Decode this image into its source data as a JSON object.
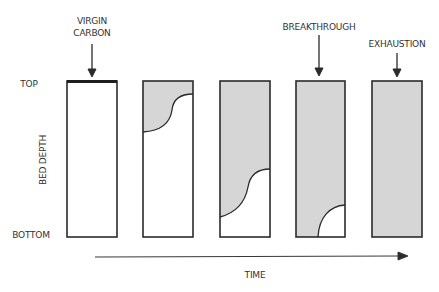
{
  "diagram": {
    "colors": {
      "outline": "#2b2b2b",
      "spent_fill": "#d6d6d6",
      "fresh_fill": "#ffffff"
    },
    "axis": {
      "y_top_label": "TOP",
      "y_bottom_label": "BOTTOM",
      "y_title": "BED DEPTH",
      "x_title": "TIME"
    },
    "annotations": [
      {
        "id": "virgin",
        "line1": "VIRGIN",
        "line2": "CARBON",
        "target_column": 1
      },
      {
        "id": "breakthrough",
        "line1": "BREAKTHROUGH",
        "line2": "",
        "target_column": 4
      },
      {
        "id": "exhaustion",
        "line1": "EXHAUSTION",
        "line2": "",
        "target_column": 5
      }
    ],
    "columns": [
      {
        "index": 1,
        "state": "virgin carbon",
        "saturated_fraction": 0.0
      },
      {
        "index": 2,
        "state": "partially loaded",
        "saturated_fraction": 0.25
      },
      {
        "index": 3,
        "state": "mass transfer zone near bottom",
        "saturated_fraction": 0.7
      },
      {
        "index": 4,
        "state": "breakthrough",
        "saturated_fraction": 0.92
      },
      {
        "index": 5,
        "state": "exhaustion",
        "saturated_fraction": 1.0
      }
    ]
  }
}
